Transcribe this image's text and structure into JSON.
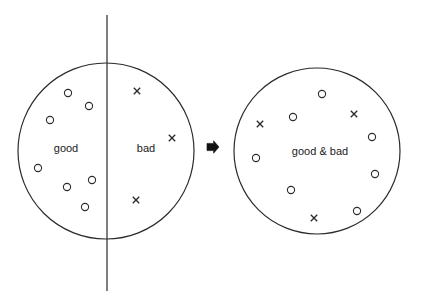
{
  "figure": {
    "stroke_color": "#2b2b2b",
    "text_color": "#1a1a1a",
    "background_color": "#ffffff"
  },
  "left_diagram": {
    "name": "separated-set",
    "circle": {
      "cx": 106,
      "cy": 151,
      "r": 88
    },
    "divider": {
      "x": 107,
      "y1": 15,
      "y2": 291
    },
    "labels": [
      {
        "id": "good-label",
        "text": "good",
        "x": 66,
        "y": 148
      },
      {
        "id": "bad-label",
        "text": "bad",
        "x": 146,
        "y": 148
      }
    ],
    "circle_markers": [
      {
        "x": 68,
        "y": 93
      },
      {
        "x": 89,
        "y": 106
      },
      {
        "x": 50,
        "y": 120
      },
      {
        "x": 38,
        "y": 168
      },
      {
        "x": 92,
        "y": 180
      },
      {
        "x": 67,
        "y": 187
      },
      {
        "x": 85,
        "y": 207
      }
    ],
    "cross_markers": [
      {
        "x": 137,
        "y": 91
      },
      {
        "x": 172,
        "y": 138
      },
      {
        "x": 136,
        "y": 200
      }
    ]
  },
  "arrow": {
    "name": "transform-arrow",
    "x": 207,
    "y": 147,
    "size": 12,
    "direction": "right"
  },
  "right_diagram": {
    "name": "merged-set",
    "circle": {
      "cx": 317,
      "cy": 151,
      "r": 83
    },
    "labels": [
      {
        "id": "good-and-bad-label",
        "text": "good & bad",
        "x": 320,
        "y": 151
      }
    ],
    "circle_markers": [
      {
        "x": 322,
        "y": 94
      },
      {
        "x": 293,
        "y": 117
      },
      {
        "x": 372,
        "y": 137
      },
      {
        "x": 256,
        "y": 158
      },
      {
        "x": 375,
        "y": 174
      },
      {
        "x": 291,
        "y": 190
      },
      {
        "x": 357,
        "y": 211
      }
    ],
    "cross_markers": [
      {
        "x": 260,
        "y": 124
      },
      {
        "x": 354,
        "y": 114
      },
      {
        "x": 314,
        "y": 218
      }
    ]
  }
}
